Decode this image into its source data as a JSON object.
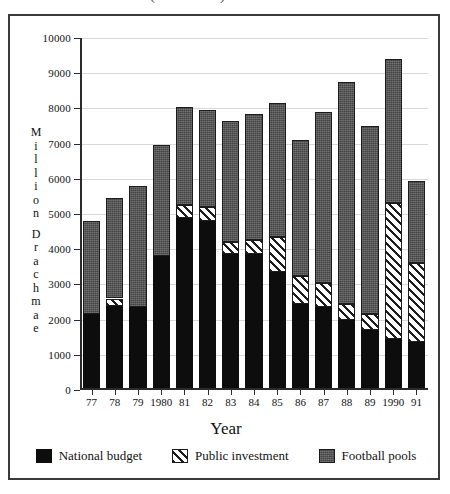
{
  "figure": {
    "clipped_title": "(1977-1991)",
    "frame_color": "#3a3a3a",
    "background": "#ffffff"
  },
  "axes": {
    "y_title_letters": [
      "M",
      "i",
      "l",
      "l",
      "i",
      "o",
      "n",
      "",
      "D",
      "r",
      "a",
      "c",
      "h",
      "m",
      "a",
      "e"
    ],
    "x_title": "Year",
    "y_ticks": [
      "0",
      "1000",
      "2000",
      "3000",
      "4000",
      "5000",
      "6000",
      "7000",
      "8000",
      "9000",
      "10000"
    ]
  },
  "legend": {
    "position": "bottom",
    "items": [
      {
        "label": "National budget",
        "key": "national_budget",
        "color": "#0d0d0d",
        "swatch": "sw-budget"
      },
      {
        "label": "Public investment",
        "key": "public_investment",
        "color": "#ffffff",
        "swatch": "sw-invest"
      },
      {
        "label": "Football pools",
        "key": "football_pools",
        "color": "#555555",
        "swatch": "sw-pools"
      }
    ]
  },
  "chart_data": {
    "type": "bar",
    "stacked": true,
    "title": "(1977-1991)",
    "xlabel": "Year",
    "ylabel": "Million Drachmae",
    "ylim": [
      0,
      10000
    ],
    "ytick_step": 1000,
    "grid": true,
    "legend_position": "bottom",
    "categories": [
      "77",
      "78",
      "79",
      "1980",
      "81",
      "82",
      "83",
      "84",
      "85",
      "86",
      "87",
      "88",
      "89",
      "1990",
      "91"
    ],
    "series": [
      {
        "name": "National budget",
        "color": "#0d0d0d",
        "values": [
          2150,
          2400,
          2350,
          3800,
          4900,
          4800,
          3850,
          3850,
          3350,
          2450,
          2350,
          2000,
          1700,
          1450,
          1350
        ]
      },
      {
        "name": "Public investment",
        "color": "#ffffff",
        "pattern": "diagonal-hatch",
        "values": [
          0,
          200,
          0,
          0,
          350,
          400,
          350,
          400,
          1000,
          800,
          700,
          450,
          450,
          3850,
          2250
        ]
      },
      {
        "name": "Football pools",
        "color": "#555555",
        "pattern": "stipple",
        "values": [
          2650,
          2850,
          3450,
          3150,
          2800,
          2750,
          3450,
          3600,
          3800,
          3850,
          4850,
          6300,
          5350,
          4100,
          2350
        ]
      }
    ],
    "totals": [
      4800,
      5450,
      5800,
      6950,
      8050,
      7950,
      7650,
      7850,
      8150,
      7100,
      7900,
      8750,
      7500,
      9400,
      5950
    ]
  }
}
